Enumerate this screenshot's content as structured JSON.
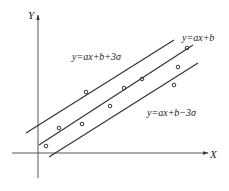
{
  "axes": {
    "x_label": "X",
    "y_label": "Y"
  },
  "lines": [
    {
      "name": "upper-control-line",
      "label": "y=ax+b+3σ",
      "x1": 26,
      "y1": 133,
      "x2": 174,
      "y2": 40
    },
    {
      "name": "regression-line",
      "label": "y=ax+b",
      "x1": 39,
      "y1": 145,
      "x2": 193,
      "y2": 45
    },
    {
      "name": "lower-control-line",
      "label": "y=ax+b−3σ",
      "x1": 49,
      "y1": 157,
      "x2": 198,
      "y2": 63
    }
  ],
  "labels": {
    "upper": "y=ax+b+3σ",
    "middle": "y=ax+b",
    "lower": "y=ax+b−3σ"
  },
  "points": [
    [
      46,
      146
    ],
    [
      59,
      128
    ],
    [
      82,
      124
    ],
    [
      86,
      92
    ],
    [
      110,
      106
    ],
    [
      124,
      88
    ],
    [
      142,
      79
    ],
    [
      174,
      85
    ],
    [
      178,
      67
    ],
    [
      187,
      48
    ]
  ],
  "colors": {
    "stroke": "#333333",
    "background": "#ffffff"
  }
}
